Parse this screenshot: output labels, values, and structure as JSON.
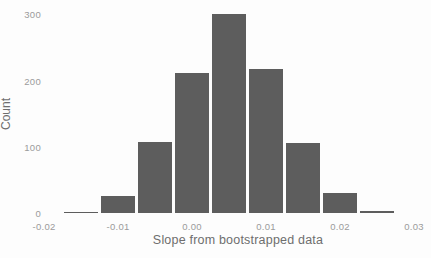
{
  "figure": {
    "background": "#fdfdfd"
  },
  "chart_data": {
    "type": "bar",
    "subtype": "histogram",
    "title": "",
    "xlabel": "Slope from bootstrapped data",
    "ylabel": "Count",
    "bar_color": "#5d5d5d",
    "bar_gap_color": "#ffffff",
    "tick_label_color": "#9b9b9b",
    "axis_title_color": "#6e6e6e",
    "grid": "off",
    "legend": "none",
    "bin_width": 0.005,
    "bin_centers": [
      -0.015,
      -0.01,
      -0.005,
      0.0,
      0.005,
      0.01,
      0.015,
      0.02,
      0.025
    ],
    "counts": [
      2,
      25,
      108,
      212,
      300,
      218,
      105,
      30,
      3
    ],
    "xticks": [
      {
        "value": -0.02,
        "label": "-0.02"
      },
      {
        "value": -0.01,
        "label": "-0.01"
      },
      {
        "value": 0.0,
        "label": "0.00"
      },
      {
        "value": 0.01,
        "label": "0.01"
      },
      {
        "value": 0.02,
        "label": "0.02"
      },
      {
        "value": 0.03,
        "label": "0.03"
      }
    ],
    "yticks": [
      {
        "value": 0,
        "label": "0"
      },
      {
        "value": 100,
        "label": "100"
      },
      {
        "value": 200,
        "label": "200"
      },
      {
        "value": 300,
        "label": "300"
      }
    ],
    "xlim": [
      -0.0225,
      0.0325
    ],
    "ylim": [
      0,
      300
    ]
  }
}
